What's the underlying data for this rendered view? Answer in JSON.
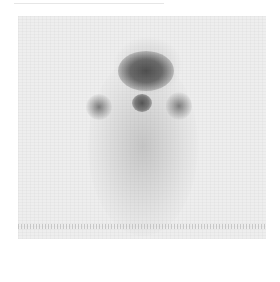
{
  "image": {
    "description": "Grayscale nuclear medicine scintigraphy scan showing focal uptake in the neck region with bilateral lateral foci",
    "colors": {
      "background": "#eeeeee",
      "uptake_dark": "#505050"
    }
  }
}
